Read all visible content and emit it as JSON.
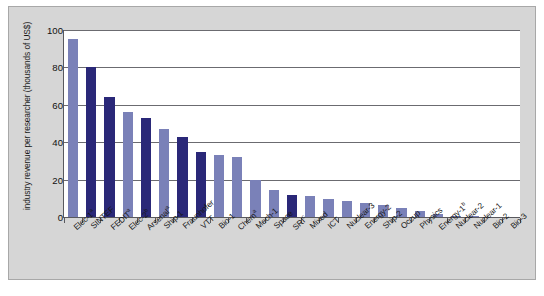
{
  "chart_data": {
    "type": "bar",
    "title": "",
    "xlabel": "",
    "ylabel": "industry revenue per researcher (thousands of US$)",
    "ylim": [
      0,
      100
    ],
    "yticks": [
      0,
      20,
      40,
      60,
      80,
      100
    ],
    "grid": true,
    "legend": false,
    "categories": [
      "Elec-1ᵃ",
      "SINTEF",
      "FEDITᵃ",
      "Elec-2ᵇ",
      "Arsenalᵃ",
      "Ship-1",
      "Fraunhofer",
      "VTT",
      "Bio-1",
      "Chemᵃ",
      "Mech-1",
      "Space",
      "SRIᶜ",
      "Mixed",
      "ICT",
      "Nuclear-3",
      "Energy-2",
      "Ship-2",
      "Occup",
      "Physics",
      "Energy-1ᵇ",
      "Nuclear-2",
      "Nuclear-1",
      "Bio-2",
      "Bio-3"
    ],
    "category_labels": [
      {
        "base": "Elec-1",
        "sup": "a"
      },
      {
        "base": "SINTEF",
        "sup": ""
      },
      {
        "base": "FEDIT",
        "sup": "a"
      },
      {
        "base": "Elec-2",
        "sup": "b"
      },
      {
        "base": "Arsenal",
        "sup": "a"
      },
      {
        "base": "Ship-1",
        "sup": ""
      },
      {
        "base": "Fraunhofer",
        "sup": ""
      },
      {
        "base": "VTT",
        "sup": ""
      },
      {
        "base": "Bio-1",
        "sup": ""
      },
      {
        "base": "Chem",
        "sup": "a"
      },
      {
        "base": "Mech-1",
        "sup": ""
      },
      {
        "base": "Space",
        "sup": ""
      },
      {
        "base": "SRI",
        "sup": "c"
      },
      {
        "base": "Mixed",
        "sup": ""
      },
      {
        "base": "ICT",
        "sup": ""
      },
      {
        "base": "Nuclear-3",
        "sup": ""
      },
      {
        "base": "Energy-2",
        "sup": ""
      },
      {
        "base": "Ship-2",
        "sup": ""
      },
      {
        "base": "Occup",
        "sup": ""
      },
      {
        "base": "Physics",
        "sup": ""
      },
      {
        "base": "Energy-1",
        "sup": "b"
      },
      {
        "base": "Nuclear-2",
        "sup": ""
      },
      {
        "base": "Nuclear-1",
        "sup": ""
      },
      {
        "base": "Bio-2",
        "sup": ""
      },
      {
        "base": "Bio-3",
        "sup": ""
      }
    ],
    "values": [
      95,
      80,
      64,
      56,
      53,
      47,
      43,
      35,
      33,
      32,
      20,
      14.5,
      12,
      11,
      9.5,
      8.5,
      7.5,
      6.5,
      5,
      3,
      1.5,
      0.8,
      0.5,
      0,
      0
    ],
    "bar_shades": [
      "light",
      "dark",
      "dark",
      "light",
      "dark",
      "light",
      "dark",
      "dark",
      "light",
      "light",
      "light",
      "light",
      "dark",
      "light",
      "light",
      "light",
      "light",
      "light",
      "light",
      "light",
      "light",
      "light",
      "light",
      "light",
      "light"
    ],
    "colors": {
      "bar_light": "#7a81b8",
      "bar_dark": "#2a2878",
      "panel_background": "#d6d6d6",
      "plot_background": "#ffffff",
      "gridline": "#6b6b70",
      "axis": "#59595e",
      "text": "#161616"
    }
  }
}
